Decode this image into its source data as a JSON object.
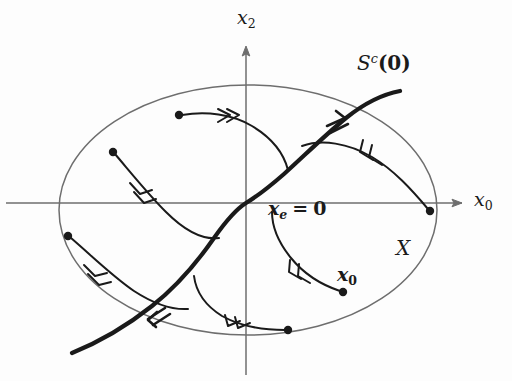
{
  "figure": {
    "name": "center-manifold-phase-portrait",
    "background_color": "#fdfdfd",
    "ink_color": "#1a1a1a",
    "axis_color": "#6e6e6e",
    "boundary_color": "#6e6e6e",
    "width": 512,
    "height": 381
  },
  "axes": {
    "origin": {
      "x": 246,
      "y": 203
    },
    "horizontal": {
      "label_parts": {
        "base": "x",
        "subscript": "0"
      },
      "label_text": "x0",
      "arrow": "right",
      "x_start": 6,
      "x_end": 466,
      "y": 203
    },
    "vertical": {
      "label_parts": {
        "base": "x",
        "subscript": "2"
      },
      "label_text": "x2",
      "arrow": "up",
      "x": 246,
      "y_start": 46,
      "y_end": 375
    }
  },
  "domain": {
    "label_parts": {
      "base": "X"
    },
    "label_text": "X",
    "shape": "ellipse",
    "center": {
      "x": 248,
      "y": 210
    },
    "radius_x": 189,
    "radius_y": 125
  },
  "manifold": {
    "label_parts": {
      "base": "S",
      "superscript": "c",
      "argument": "0"
    },
    "label_text": "Sc(0)",
    "description": "center manifold through the equilibrium",
    "stroke_width": 4.2,
    "arrow_directions": [
      "up-right",
      "down-left"
    ]
  },
  "equilibrium": {
    "label_parts": {
      "base": "x",
      "subscript": "e",
      "relation": "=",
      "value": "0"
    },
    "label_text": "xe = 0",
    "position": {
      "x": 246,
      "y": 203
    }
  },
  "initial_condition": {
    "label_parts": {
      "base": "x",
      "subscript": "0"
    },
    "label_text": "x0",
    "dot": {
      "x": 343,
      "y": 292
    }
  },
  "trajectories": [
    {
      "id": "traj-upper-left-1",
      "start_dot": {
        "x": 179,
        "y": 115
      },
      "arrow_direction": "right"
    },
    {
      "id": "traj-upper-left-2",
      "start_dot": {
        "x": 113,
        "y": 152
      },
      "arrow_direction": "down-right"
    },
    {
      "id": "traj-lower-left-3",
      "start_dot": {
        "x": 68,
        "y": 236
      },
      "arrow_direction": "down-right"
    },
    {
      "id": "traj-right-4",
      "start_dot": {
        "x": 430,
        "y": 211
      },
      "arrow_direction": "up-left"
    },
    {
      "id": "traj-lower-right-5",
      "start_dot": {
        "x": 343,
        "y": 292
      },
      "arrow_direction": "up-left"
    },
    {
      "id": "traj-bottom-6",
      "start_dot": {
        "x": 288,
        "y": 330
      },
      "arrow_direction": "left"
    }
  ]
}
